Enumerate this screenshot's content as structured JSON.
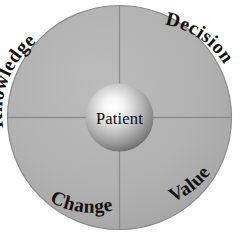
{
  "diagram": {
    "type": "circular-quadrant-wheel",
    "center": {
      "label": "Patient",
      "shape": "sphere",
      "fill_highlight": "#ffffff",
      "fill_mid": "#c9c9c9",
      "fill_edge": "#6f6f6f"
    },
    "ring": {
      "fill": "#b3b3b3",
      "stroke": "#8a8a8a",
      "divider_color": "#8d8d8d"
    },
    "quadrants": [
      {
        "id": "knowledge",
        "label": "Knowledge",
        "position": "top-left",
        "text_path": "arc-top-left"
      },
      {
        "id": "decision",
        "label": "Decision",
        "position": "top-right",
        "text_path": "arc-top-right"
      },
      {
        "id": "change",
        "label": "Change",
        "position": "bottom-left",
        "text_path": "arc-bottom-left"
      },
      {
        "id": "value",
        "label": "Value",
        "position": "bottom-right",
        "text_path": "arc-bottom-right"
      }
    ]
  }
}
